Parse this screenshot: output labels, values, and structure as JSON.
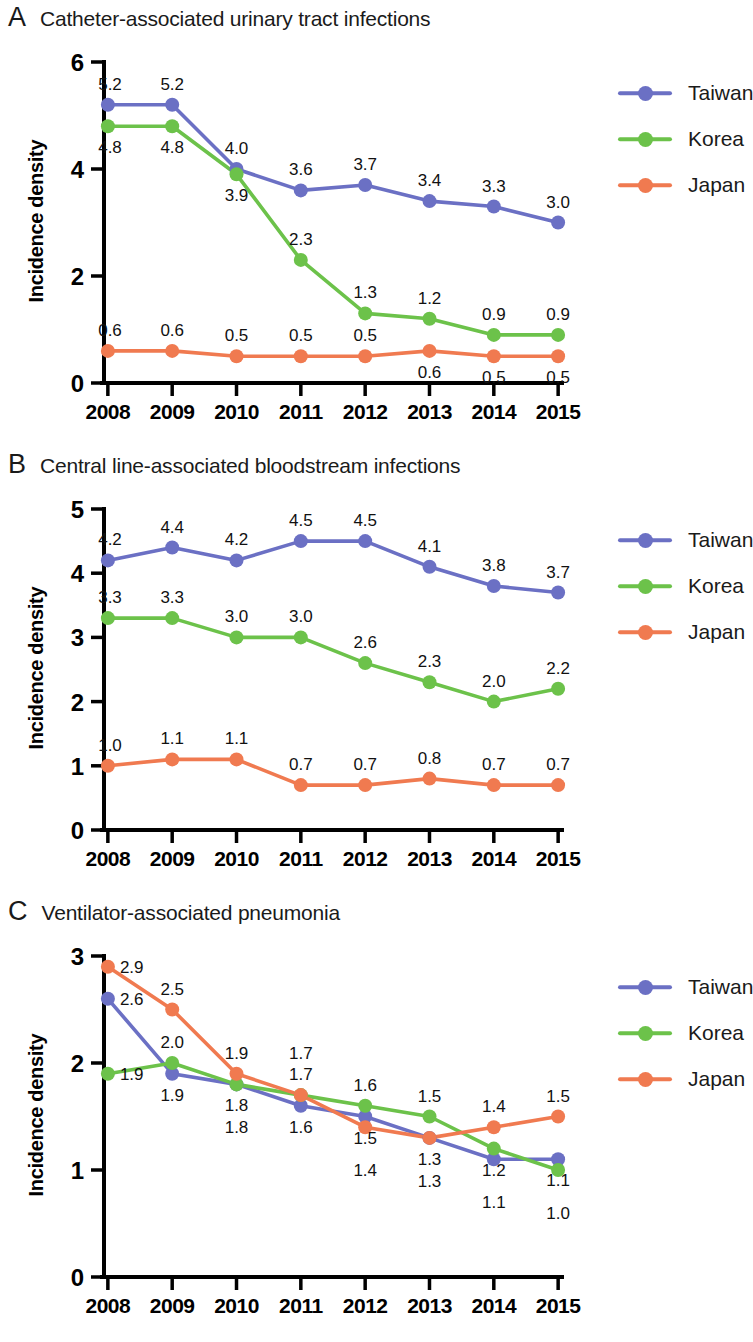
{
  "figure": {
    "ylabel": "Incidence density",
    "years": [
      "2008",
      "2009",
      "2010",
      "2011",
      "2012",
      "2013",
      "2014",
      "2015"
    ],
    "series_names": [
      "Taiwan",
      "Korea",
      "Japan"
    ],
    "colors": {
      "Taiwan": "#6b70c4",
      "Korea": "#6cc24a",
      "Japan": "#f07a50"
    }
  },
  "legend": {
    "items": [
      {
        "label": "Taiwan",
        "color": "#6b70c4"
      },
      {
        "label": "Korea",
        "color": "#6cc24a"
      },
      {
        "label": "Japan",
        "color": "#f07a50"
      }
    ]
  },
  "panels": [
    {
      "letter": "A",
      "title": "Catheter-associated urinary tract infections",
      "chart_data": {
        "type": "line",
        "title": "Catheter-associated urinary tract infections",
        "xlabel": "",
        "ylabel": "Incidence density",
        "x": [
          "2008",
          "2009",
          "2010",
          "2011",
          "2012",
          "2013",
          "2014",
          "2015"
        ],
        "ylim": [
          0,
          6
        ],
        "yticks": [
          0,
          2,
          4,
          6
        ],
        "grid": false,
        "legend_position": "right",
        "series": [
          {
            "name": "Taiwan",
            "color": "#6b70c4",
            "values": [
              5.2,
              5.2,
              4.0,
              3.6,
              3.7,
              3.4,
              3.3,
              3.0
            ],
            "labels": [
              "5.2",
              "5.2",
              "4.0",
              "3.6",
              "3.7",
              "3.4",
              "3.3",
              "3.0"
            ],
            "label_pos": [
              "above",
              "above",
              "above",
              "above",
              "above",
              "above",
              "above",
              "above"
            ]
          },
          {
            "name": "Korea",
            "color": "#6cc24a",
            "values": [
              4.8,
              4.8,
              3.9,
              2.3,
              1.3,
              1.2,
              0.9,
              0.9
            ],
            "labels": [
              "4.8",
              "4.8",
              "3.9",
              "2.3",
              "1.3",
              "1.2",
              "0.9",
              "0.9"
            ],
            "label_pos": [
              "below",
              "below",
              "below",
              "above",
              "above",
              "above",
              "above",
              "above"
            ]
          },
          {
            "name": "Japan",
            "color": "#f07a50",
            "values": [
              0.6,
              0.6,
              0.5,
              0.5,
              0.5,
              0.6,
              0.5,
              0.5
            ],
            "labels": [
              "0.6",
              "0.6",
              "0.5",
              "0.5",
              "0.5",
              "0.6",
              "0.5",
              "0.5"
            ],
            "label_pos": [
              "above",
              "above",
              "above",
              "above",
              "above",
              "below",
              "below",
              "below"
            ]
          }
        ]
      }
    },
    {
      "letter": "B",
      "title": "Central line-associated bloodstream infections",
      "chart_data": {
        "type": "line",
        "title": "Central line-associated bloodstream infections",
        "xlabel": "",
        "ylabel": "Incidence density",
        "x": [
          "2008",
          "2009",
          "2010",
          "2011",
          "2012",
          "2013",
          "2014",
          "2015"
        ],
        "ylim": [
          0,
          5
        ],
        "yticks": [
          0,
          1,
          2,
          3,
          4,
          5
        ],
        "grid": false,
        "legend_position": "right",
        "series": [
          {
            "name": "Taiwan",
            "color": "#6b70c4",
            "values": [
              4.2,
              4.4,
              4.2,
              4.5,
              4.5,
              4.1,
              3.8,
              3.7
            ],
            "labels": [
              "4.2",
              "4.4",
              "4.2",
              "4.5",
              "4.5",
              "4.1",
              "3.8",
              "3.7"
            ],
            "label_pos": [
              "above",
              "above",
              "above",
              "above",
              "above",
              "above",
              "above",
              "above"
            ]
          },
          {
            "name": "Korea",
            "color": "#6cc24a",
            "values": [
              3.3,
              3.3,
              3.0,
              3.0,
              2.6,
              2.3,
              2.0,
              2.2
            ],
            "labels": [
              "3.3",
              "3.3",
              "3.0",
              "3.0",
              "2.6",
              "2.3",
              "2.0",
              "2.2"
            ],
            "label_pos": [
              "above",
              "above",
              "above",
              "above",
              "above",
              "above",
              "above",
              "above"
            ]
          },
          {
            "name": "Japan",
            "color": "#f07a50",
            "values": [
              1.0,
              1.1,
              1.1,
              0.7,
              0.7,
              0.8,
              0.7,
              0.7
            ],
            "labels": [
              "1.0",
              "1.1",
              "1.1",
              "0.7",
              "0.7",
              "0.8",
              "0.7",
              "0.7"
            ],
            "label_pos": [
              "above",
              "above",
              "above",
              "above",
              "above",
              "above",
              "above",
              "above"
            ]
          }
        ]
      }
    },
    {
      "letter": "C",
      "title": "Ventilator-associated pneumonia",
      "chart_data": {
        "type": "line",
        "title": "Ventilator-associated pneumonia",
        "xlabel": "",
        "ylabel": "Incidence density",
        "x": [
          "2008",
          "2009",
          "2010",
          "2011",
          "2012",
          "2013",
          "2014",
          "2015"
        ],
        "ylim": [
          0,
          3
        ],
        "yticks": [
          0,
          1,
          2,
          3
        ],
        "grid": false,
        "legend_position": "right",
        "series": [
          {
            "name": "Taiwan",
            "color": "#6b70c4",
            "values": [
              2.6,
              1.9,
              1.8,
              1.6,
              1.5,
              1.3,
              1.1,
              1.1
            ],
            "labels": [
              "2.6",
              "1.9",
              "1.8",
              "1.6",
              "1.5",
              "1.3",
              "1.1",
              "1.1"
            ],
            "label_pos": [
              "right",
              "below",
              "below",
              "below",
              "below",
              "below",
              "below2",
              "below"
            ]
          },
          {
            "name": "Korea",
            "color": "#6cc24a",
            "values": [
              1.9,
              2.0,
              1.8,
              1.7,
              1.6,
              1.5,
              1.2,
              1.0
            ],
            "labels": [
              "1.9",
              "2.0",
              "1.8",
              "1.7",
              "1.6",
              "1.5",
              "1.2",
              "1.0"
            ],
            "label_pos": [
              "right",
              "above",
              "below2",
              "above",
              "above",
              "above",
              "below",
              "below2"
            ]
          },
          {
            "name": "Japan",
            "color": "#f07a50",
            "values": [
              2.9,
              2.5,
              1.9,
              1.7,
              1.4,
              1.3,
              1.4,
              1.5
            ],
            "labels": [
              "2.9",
              "2.5",
              "1.9",
              "1.7",
              "1.4",
              "1.3",
              "1.4",
              "1.5"
            ],
            "label_pos": [
              "right",
              "above",
              "above",
              "above2",
              "below2",
              "below2",
              "above",
              "above"
            ]
          }
        ]
      }
    }
  ]
}
